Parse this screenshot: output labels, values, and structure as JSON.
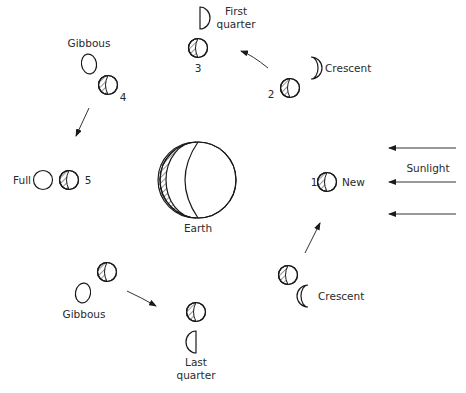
{
  "earth": {
    "label": "Earth"
  },
  "sunlight": {
    "label": "Sunlight",
    "arrow_count": 3
  },
  "positions": [
    {
      "number": "1",
      "phase": "New"
    },
    {
      "number": "2",
      "phase": "Crescent"
    },
    {
      "number": "3",
      "phase_line1": "First",
      "phase_line2": "quarter"
    },
    {
      "number": "4",
      "phase": "Gibbous"
    },
    {
      "number": "5",
      "phase": "Full"
    },
    {
      "number": "",
      "phase": "Gibbous"
    },
    {
      "number": "",
      "phase_line1": "Last",
      "phase_line2": "quarter"
    },
    {
      "number": "",
      "phase": "Crescent"
    }
  ],
  "colors": {
    "line": "#1a1a1a",
    "text": "#2a2a2a",
    "background": "#ffffff"
  }
}
